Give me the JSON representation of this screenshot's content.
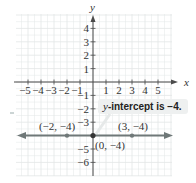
{
  "chart_data": {
    "type": "line",
    "title": "",
    "xlabel": "x",
    "ylabel": "y",
    "xlim": [
      -6,
      6
    ],
    "ylim": [
      -7,
      5
    ],
    "grid": true,
    "x_ticks": [
      -5,
      -4,
      -3,
      -2,
      -1,
      1,
      2,
      3,
      4,
      5
    ],
    "y_ticks": [
      4,
      3,
      2,
      1,
      -1,
      -2,
      -3,
      -5,
      -6
    ],
    "x_tick_labels": [
      "−5",
      "−4",
      "−3",
      "−2",
      "−1",
      "1",
      "2",
      "3",
      "4",
      "5"
    ],
    "y_tick_labels": [
      "4",
      "3",
      "2",
      "1",
      "−1",
      "−2",
      "−3",
      "−5",
      "−6"
    ],
    "series": [
      {
        "name": "y = −4",
        "type": "horizontal-line",
        "equation": "y = -4",
        "color": "#6f7878",
        "x": [
          -6,
          6
        ],
        "y": [
          -4,
          -4
        ]
      }
    ],
    "points": [
      {
        "x": -2,
        "y": -4,
        "label": "(−2, −4)"
      },
      {
        "x": 0,
        "y": -4,
        "label": "(0, −4)"
      },
      {
        "x": 3,
        "y": -4,
        "label": "(3, −4)"
      }
    ],
    "annotations": [
      {
        "text_italic": "y",
        "text": "-intercept is −4.",
        "target": {
          "x": 0,
          "y": -4
        }
      }
    ]
  },
  "colors": {
    "grid": "#e2e6e6",
    "axis": "#4a4a4a",
    "line": "#6f7878",
    "point": "#6f7878",
    "callout_bg": "#eef0f0"
  }
}
